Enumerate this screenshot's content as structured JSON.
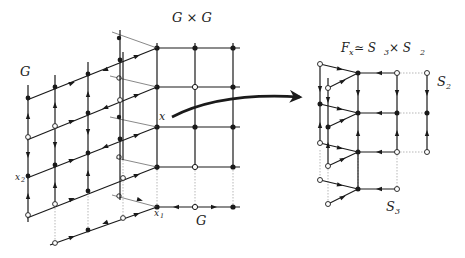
{
  "labels": {
    "product": "G × G",
    "G_left": "G",
    "G_bottom": "G",
    "x": "x",
    "x1": "x",
    "x1_sub": "1",
    "x2": "x",
    "x2_sub": "2",
    "fiber": "F",
    "fiber_sub": "x",
    "fiber_rel": " ≃ S",
    "fiber_s3": "3",
    "fiber_times": " × S",
    "fiber_s2": "2",
    "S2": "S",
    "S2_sub": "2",
    "S3": "S",
    "S3_sub": "3"
  },
  "colors": {
    "ink": "#1a1a1a",
    "dotted": "#999999",
    "background": "#ffffff"
  },
  "diagram": {
    "left": {
      "name": "G × G product graph with gradient flow",
      "front_grid_columns_x": [
        157,
        195,
        233
      ],
      "front_grid_rows_y": [
        48,
        87,
        127,
        167,
        207
      ],
      "open_vertices": [
        [
          195,
          87
        ],
        [
          195,
          167
        ],
        [
          195,
          207
        ]
      ]
    },
    "arrow": {
      "from": [
        172,
        117
      ],
      "to": [
        302,
        97
      ],
      "meaning": "maps point x to its fiber"
    },
    "right": {
      "name": "Fiber F_x ≃ S3 × S2",
      "columns_x": [
        320,
        328,
        358,
        397,
        427
      ],
      "rows_y": [
        73,
        113,
        152,
        189
      ]
    }
  }
}
